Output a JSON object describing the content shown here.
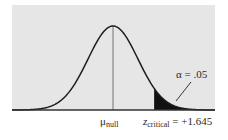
{
  "chart_data": {
    "type": "area",
    "title": "",
    "subtitle": "",
    "xlabel": "",
    "ylabel": "",
    "distribution": "normal",
    "mean_label": "μ",
    "mean_label_sub": "null",
    "critical_label": "z",
    "critical_label_sub": "critical",
    "critical_value_text": " = +1.645",
    "critical_z": 1.645,
    "alpha_text": "α = .05",
    "alpha": 0.05,
    "tail": "right",
    "grid": false,
    "legend": "none",
    "xlim_z": [
      -4.0,
      4.05
    ],
    "colors": {
      "background": "#e6e6e6",
      "curve": "#1e1e1e",
      "shaded": "#111111",
      "axis": "#333333",
      "mean_line": "#555555"
    }
  }
}
